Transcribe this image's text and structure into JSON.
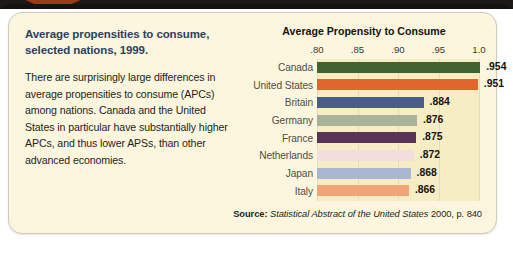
{
  "card": {
    "headline": "Average propensities to consume, selected nations, 1999.",
    "body": "There are surprisingly large differences in average propensities to consume (APCs) among nations. Canada and the United States in particular have substantially higher APCs, and thus lower APSs, than other advanced economies.",
    "background_color": "#fbf6dd"
  },
  "source": {
    "label": "Source:",
    "title": "Statistical Abstract of the United States",
    "rest": "2000, p. 840"
  },
  "chart_data": {
    "type": "bar",
    "orientation": "horizontal",
    "title": "Average Propensity to Consume",
    "xlabel": "",
    "ylabel": "",
    "xlim": [
      0.8,
      1.0
    ],
    "grid": true,
    "legend": "none",
    "tick_labels": [
      ".80",
      ".85",
      ".90",
      ".95",
      "1.0"
    ],
    "tick_values": [
      0.8,
      0.85,
      0.9,
      0.95,
      1.0
    ],
    "categories": [
      "Canada",
      "United States",
      "Britain",
      "Germany",
      "France",
      "Netherlands",
      "Japan",
      "Italy"
    ],
    "values": [
      0.954,
      0.951,
      0.884,
      0.876,
      0.875,
      0.872,
      0.868,
      0.866
    ],
    "value_labels": [
      ".954",
      ".951",
      ".884",
      ".876",
      ".875",
      ".872",
      ".868",
      ".866"
    ],
    "bar_colors": [
      "#41612f",
      "#e1662c",
      "#4a5b8e",
      "#a9b29b",
      "#5a3457",
      "#f2dfdd",
      "#a9b6d4",
      "#f0a477"
    ],
    "bars": [
      {
        "category": "Canada",
        "value": 0.954,
        "label": ".954",
        "color": "#41612f"
      },
      {
        "category": "United States",
        "value": 0.951,
        "label": ".951",
        "color": "#e1662c"
      },
      {
        "category": "Britain",
        "value": 0.884,
        "label": ".884",
        "color": "#4a5b8e"
      },
      {
        "category": "Germany",
        "value": 0.876,
        "label": ".876",
        "color": "#a9b29b"
      },
      {
        "category": "France",
        "value": 0.875,
        "label": ".875",
        "color": "#5a3457"
      },
      {
        "category": "Netherlands",
        "value": 0.872,
        "label": ".872",
        "color": "#f2dfdd"
      },
      {
        "category": "Japan",
        "value": 0.868,
        "label": ".868",
        "color": "#a9b6d4"
      },
      {
        "category": "Italy",
        "value": 0.866,
        "label": ".866",
        "color": "#f0a477"
      }
    ]
  }
}
